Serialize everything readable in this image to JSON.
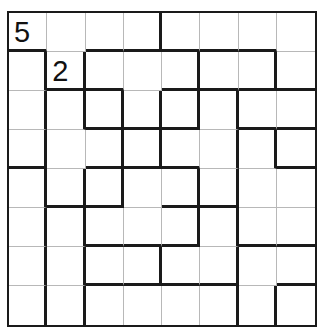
{
  "puzzle": {
    "rows": 8,
    "cols": 8,
    "clues": [
      {
        "row": 0,
        "col": 0,
        "value": "5"
      },
      {
        "row": 1,
        "col": 1,
        "value": "2"
      }
    ],
    "thick_right": [
      [
        3
      ],
      [
        0,
        1,
        4,
        6
      ],
      [
        0,
        1,
        2,
        3,
        4,
        5
      ],
      [
        0,
        2,
        3,
        5,
        6
      ],
      [
        0,
        1,
        2,
        4,
        5
      ],
      [
        0,
        1,
        4,
        5
      ],
      [
        0,
        1,
        3,
        5
      ],
      [
        0,
        1,
        5,
        6
      ]
    ],
    "thick_bottom": [
      [
        0,
        2,
        3,
        4,
        5,
        6
      ],
      [
        1,
        2,
        4,
        5,
        6,
        7
      ],
      [
        2,
        3,
        4,
        6,
        7
      ],
      [
        0,
        2,
        3,
        4,
        7
      ],
      [
        1,
        2,
        4,
        5
      ],
      [
        2,
        3,
        4,
        6,
        7
      ],
      [
        2,
        3,
        4,
        5,
        7
      ],
      []
    ]
  }
}
